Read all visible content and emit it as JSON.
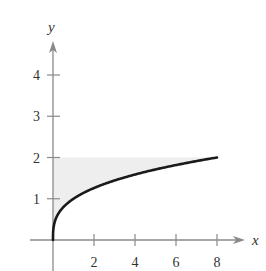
{
  "chart_data": {
    "type": "area",
    "title": "",
    "xlabel": "x",
    "ylabel": "y",
    "xlim": [
      -1.1,
      9.1
    ],
    "ylim": [
      0,
      4.8
    ],
    "x_ticks": [
      2,
      4,
      6,
      8
    ],
    "x_tick_labels": [
      "2",
      "4",
      "6",
      "8"
    ],
    "y_ticks": [
      1,
      2,
      3,
      4
    ],
    "y_tick_labels": [
      "1",
      "2",
      "3",
      "4"
    ],
    "grid": false,
    "legend": null,
    "series": [
      {
        "name": "y = x^(1/3)",
        "function": "y = cbrt(x)",
        "domain": [
          0,
          8
        ],
        "x": [
          0,
          0.125,
          0.5,
          1,
          2,
          3,
          4,
          5,
          6,
          7,
          8
        ],
        "values": [
          0,
          0.5,
          0.794,
          1,
          1.26,
          1.442,
          1.587,
          1.71,
          1.817,
          1.913,
          2
        ],
        "color": "#1a1a1a"
      }
    ],
    "shaded_region": {
      "description": "region bounded by the y-axis, the line y = 2, and the curve y = cbrt(x)",
      "bounds": {
        "x": [
          0,
          8
        ],
        "y": [
          0,
          2
        ]
      },
      "color": "#eeeeee"
    }
  },
  "colors": {
    "axis": "#8a8a8a",
    "curve": "#1a1a1a",
    "shade": "#eeeeee",
    "text": "#333333"
  }
}
